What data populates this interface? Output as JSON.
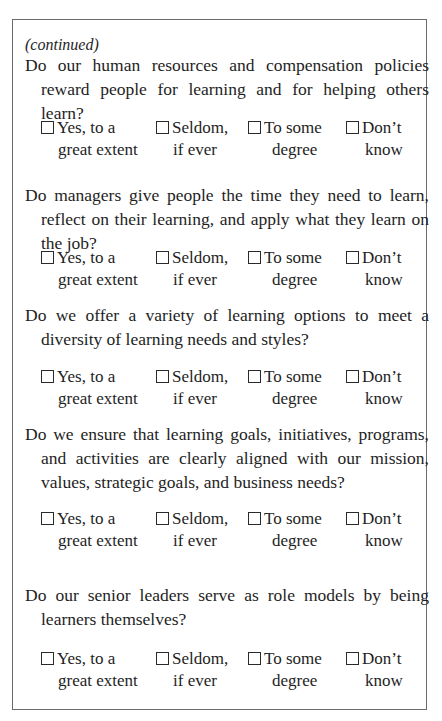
{
  "continued_label": "(continued)",
  "options": {
    "yes": {
      "line1": "Yes, to a",
      "line2": "great extent"
    },
    "seldom": {
      "line1": "Seldom,",
      "line2": "if ever"
    },
    "some": {
      "line1": "To some",
      "line2": "degree"
    },
    "dontknow": {
      "line1": "Don’t",
      "line2": "know"
    }
  },
  "questions": [
    {
      "text": "Do our human resources and compensation policies reward people for learning and for helping others learn?"
    },
    {
      "text": "Do managers give people the time they need to learn, reflect on their learning, and apply what they learn on the job?"
    },
    {
      "text": "Do we offer a variety of learning options to meet a diversity of learning needs and styles?"
    },
    {
      "text": "Do we ensure that learning goals, initiatives, programs, and activities are clearly aligned with our mission, values, strategic goals, and business needs?"
    },
    {
      "text": "Do our senior leaders serve as role models by being learners themselves?"
    }
  ]
}
